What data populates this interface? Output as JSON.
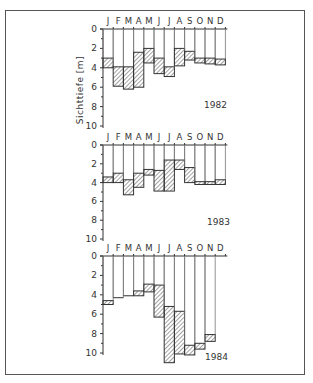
{
  "figure": {
    "y_axis_label": "Sichttiefe [m]",
    "months": [
      "J",
      "F",
      "M",
      "A",
      "M",
      "J",
      "J",
      "A",
      "S",
      "O",
      "N",
      "D"
    ],
    "colors": {
      "frame": "#555555",
      "ink": "#333333",
      "hatch": "#444444",
      "background": "#ffffff"
    }
  },
  "chart_data": [
    {
      "type": "bar",
      "subtype": "floating-range (min-max)",
      "title": "1982",
      "xlabel": "",
      "ylabel": "Sichttiefe [m]",
      "categories": [
        "J",
        "F",
        "M",
        "A",
        "M",
        "J",
        "J",
        "A",
        "S",
        "O",
        "N",
        "D"
      ],
      "y_inverted": true,
      "ylim": [
        0,
        10
      ],
      "yticks": [
        0,
        2,
        4,
        6,
        8,
        10
      ],
      "series": [
        {
          "name": "min",
          "values": [
            3.0,
            3.9,
            3.9,
            2.4,
            2.0,
            3.0,
            3.9,
            2.0,
            2.3,
            3.0,
            3.0,
            3.1
          ]
        },
        {
          "name": "max",
          "values": [
            4.0,
            5.9,
            6.2,
            6.0,
            3.5,
            4.6,
            4.9,
            3.8,
            3.2,
            3.5,
            3.6,
            3.7
          ]
        }
      ]
    },
    {
      "type": "bar",
      "subtype": "floating-range (min-max)",
      "title": "1983",
      "xlabel": "",
      "ylabel": "Sichttiefe [m]",
      "categories": [
        "J",
        "F",
        "M",
        "A",
        "M",
        "J",
        "J",
        "A",
        "S",
        "O",
        "N",
        "D"
      ],
      "y_inverted": true,
      "ylim": [
        0,
        10
      ],
      "yticks": [
        0,
        2,
        4,
        6,
        8,
        10
      ],
      "series": [
        {
          "name": "min",
          "values": [
            3.4,
            3.0,
            3.7,
            3.0,
            2.6,
            2.7,
            1.6,
            1.6,
            2.4,
            3.9,
            3.9,
            3.7
          ]
        },
        {
          "name": "max",
          "values": [
            4.0,
            4.0,
            5.3,
            4.5,
            3.2,
            4.9,
            4.9,
            2.6,
            4.0,
            4.2,
            4.2,
            4.2
          ]
        }
      ]
    },
    {
      "type": "bar",
      "subtype": "floating-range (min-max)",
      "title": "1984",
      "xlabel": "",
      "ylabel": "Sichttiefe [m]",
      "categories": [
        "J",
        "F",
        "M",
        "A",
        "M",
        "J",
        "J",
        "A",
        "S",
        "O",
        "N",
        "D"
      ],
      "y_inverted": true,
      "ylim": [
        0,
        10
      ],
      "yticks": [
        0,
        2,
        4,
        6,
        8,
        10
      ],
      "series": [
        {
          "name": "min",
          "values": [
            4.6,
            4.3,
            4.1,
            3.6,
            2.9,
            3.0,
            5.2,
            5.7,
            9.2,
            9.0,
            8.1,
            null
          ]
        },
        {
          "name": "max",
          "values": [
            5.0,
            4.3,
            4.1,
            4.1,
            3.7,
            6.3,
            11.0,
            10.1,
            10.2,
            9.6,
            8.8,
            null
          ]
        }
      ]
    }
  ],
  "layout": {
    "panels": [
      {
        "zero_y": 29,
        "px_per_m": 9.7,
        "month_label_y": 24,
        "year_label_x": 204,
        "year_label_y": 108
      },
      {
        "zero_y": 145,
        "px_per_m": 9.4,
        "month_label_y": 140,
        "year_label_x": 207,
        "year_label_y": 225
      },
      {
        "zero_y": 256,
        "px_per_m": 9.7,
        "month_label_y": 251,
        "year_label_x": 205,
        "year_label_y": 360
      }
    ],
    "axis_x": 103,
    "col_width": 10.2
  }
}
